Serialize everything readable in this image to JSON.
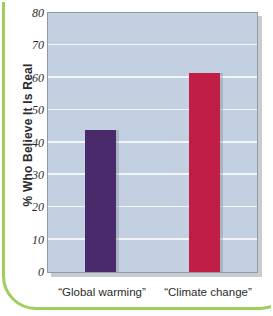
{
  "chart_data": {
    "type": "bar",
    "title": "",
    "xlabel": "",
    "ylabel": "% Who Believe It Is Real",
    "ylim": [
      0,
      80
    ],
    "ytick_step": 10,
    "yticks": [
      "0",
      "10",
      "20",
      "30",
      "40",
      "50",
      "60",
      "70",
      "80"
    ],
    "grid": true,
    "legend": "none",
    "categories": [
      "“Global warming”",
      "“Climate change”"
    ],
    "values": [
      44,
      61.5
    ],
    "series": [
      {
        "name": "% Who Believe It Is Real",
        "values": [
          44,
          61.5
        ]
      }
    ],
    "bar_colors": [
      "#4a2a6b",
      "#c01e45"
    ],
    "plot_background": "#c3d0e2",
    "gridline_color": "#f2f5fa",
    "frame_accent_color": "#9fce5a"
  }
}
